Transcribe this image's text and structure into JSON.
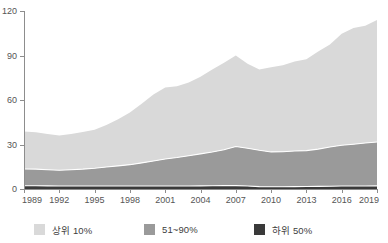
{
  "chart_data": {
    "type": "area",
    "stacked": true,
    "title": "",
    "xlabel": "",
    "ylabel": "",
    "ylim": [
      0,
      120
    ],
    "yticks": [
      0,
      30,
      60,
      90,
      120
    ],
    "ytick_labels": [
      "0",
      "30",
      "60",
      "90",
      "120"
    ],
    "xlim": [
      1989,
      2019
    ],
    "xticks": [
      1989,
      1992,
      1995,
      1998,
      2001,
      2004,
      2007,
      2010,
      2013,
      2016,
      2019
    ],
    "xtick_labels": [
      "1989",
      "1992",
      "1995",
      "1998",
      "2001",
      "2004",
      "2007",
      "2010",
      "2013",
      "2016",
      "2019"
    ],
    "grid": false,
    "legend_position": "bottom",
    "x": [
      1989,
      1990,
      1991,
      1992,
      1993,
      1994,
      1995,
      1996,
      1997,
      1998,
      1999,
      2000,
      2001,
      2002,
      2003,
      2004,
      2005,
      2006,
      2007,
      2008,
      2009,
      2010,
      2011,
      2012,
      2013,
      2014,
      2015,
      2016,
      2017,
      2018,
      2019
    ],
    "series": [
      {
        "name": "하위 50%",
        "color": "#3a3a3a",
        "values": [
          2.2,
          2.2,
          2.1,
          2.0,
          2.0,
          2.0,
          2.0,
          2.0,
          2.0,
          2.0,
          2.0,
          2.0,
          2.0,
          2.0,
          2.0,
          2.1,
          2.2,
          2.3,
          2.3,
          2.0,
          1.6,
          1.5,
          1.5,
          1.6,
          1.7,
          1.8,
          1.9,
          2.0,
          2.0,
          2.0,
          2.1
        ]
      },
      {
        "name": "51~90%",
        "color": "#9a9a9a",
        "values": [
          11.3,
          11.2,
          10.9,
          10.6,
          11.0,
          11.4,
          12.0,
          12.8,
          13.6,
          14.4,
          15.6,
          16.9,
          18.2,
          19.2,
          20.4,
          21.6,
          22.8,
          24.2,
          26.3,
          25.5,
          24.5,
          23.5,
          23.6,
          24.0,
          24.2,
          25.1,
          26.4,
          27.5,
          28.2,
          29.0,
          29.6
        ]
      },
      {
        "name": "상위 10%",
        "color": "#d9d9d9",
        "values": [
          25.3,
          24.9,
          24.0,
          23.4,
          24.1,
          25.1,
          26.0,
          28.3,
          31.5,
          35.1,
          39.9,
          44.8,
          48.2,
          48.0,
          49.4,
          52.0,
          55.5,
          58.6,
          61.4,
          57.0,
          54.4,
          57.0,
          58.4,
          60.3,
          61.6,
          65.8,
          69.1,
          75.2,
          78.3,
          79.0,
          82.3
        ]
      }
    ],
    "totals_note": ""
  },
  "legend": {
    "items": [
      {
        "label": "상위 10%",
        "color": "#d9d9d9",
        "swatch_name": "legend-swatch-top10"
      },
      {
        "label": "51~90%",
        "color": "#9a9a9a",
        "swatch_name": "legend-swatch-mid"
      },
      {
        "label": "하위 50%",
        "color": "#3a3a3a",
        "swatch_name": "legend-swatch-bottom50"
      }
    ]
  },
  "axes": {
    "y_tick_labels": [
      "120",
      "90",
      "60",
      "30",
      "0"
    ],
    "x_tick_labels": [
      "1989",
      "1992",
      "1995",
      "1998",
      "2001",
      "2004",
      "2007",
      "2010",
      "2013",
      "2016",
      "2019"
    ]
  }
}
